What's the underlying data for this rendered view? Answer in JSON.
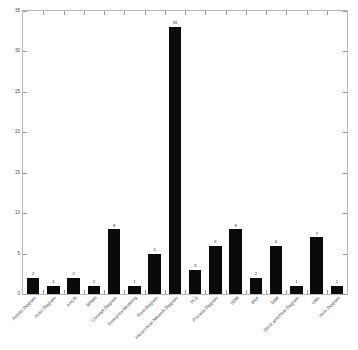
{
  "chart_data": {
    "type": "bar",
    "title": "",
    "subtitle": "",
    "xlabel": "",
    "ylabel": "",
    "categories": [
      "Activity Diagram",
      "Actor Diagram",
      "AHCN",
      "BPMN",
      "Concept Diagram",
      "Enterprise Modeling",
      "Flow Diagram",
      "Hierarchical Network Diagram",
      "PLS",
      "Process Diagram",
      "SDM",
      "SNA",
      "SSM",
      "Stock and Flow Diagram",
      "UML",
      "Venn Diagram"
    ],
    "values": [
      2,
      1,
      2,
      1,
      8,
      1,
      5,
      33,
      3,
      6,
      8,
      2,
      6,
      1,
      7,
      1
    ],
    "value_labels": [
      "2",
      "1",
      "2",
      "1",
      "8",
      "1",
      "5",
      "33",
      "3",
      "6",
      "8",
      "2",
      "6",
      "1",
      "7",
      "1"
    ],
    "ylim": [
      0,
      35
    ],
    "yticks": [
      0,
      5,
      10,
      15,
      20,
      25,
      30,
      35
    ],
    "ytick_labels": [
      "0",
      "5",
      "10",
      "15",
      "20",
      "25",
      "30",
      "35"
    ],
    "grid": false,
    "legend": null,
    "legend_position": "none",
    "bar_color": "#0a0a0a",
    "axis_color": "#b9b9b9",
    "background_color": "#ffffff",
    "xtick_rotation": -45
  }
}
